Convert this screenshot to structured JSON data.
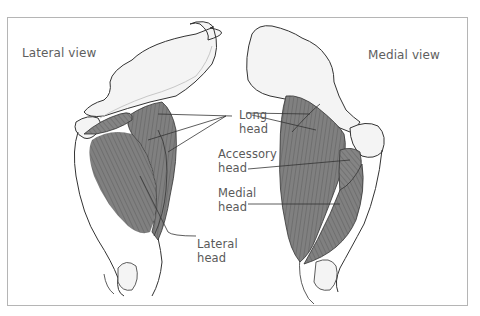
{
  "figure": {
    "views": {
      "lateral": "Lateral view",
      "medial": "Medial view"
    },
    "labels": {
      "long_head_1": "Long",
      "long_head_2": "head",
      "accessory_head_1": "Accessory",
      "accessory_head_2": "head",
      "medial_head_1": "Medial",
      "medial_head_2": "head",
      "lateral_head_1": "Lateral",
      "lateral_head_2": "head"
    },
    "colors": {
      "muscle": "#7d7d7d",
      "muscle_striation": "#5c5c5c",
      "bone": "#f3f3f3",
      "outline": "#333333",
      "frame": "#b5b5b5",
      "text": "#5a5a5a"
    }
  }
}
